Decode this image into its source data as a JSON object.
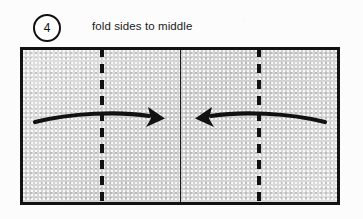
{
  "page": {
    "background_color": "#fcfcfc",
    "width": 363,
    "height": 219
  },
  "step": {
    "number": "4",
    "caption": "fold sides to middle",
    "badge_shape": "circle",
    "badge_border_color": "#111111",
    "text_color": "#1a1a1a"
  },
  "figure": {
    "name": "paper-rectangle",
    "fill_color": "#d4d4d4",
    "border_color": "#121212",
    "border_width_px": 3,
    "x": 20,
    "y": 47,
    "width": 320,
    "height": 158,
    "creases": [
      {
        "name": "left-fold-line",
        "style": "dashed",
        "orientation": "vertical",
        "x_percent": 24.4,
        "color": "#111111"
      },
      {
        "name": "center-line",
        "style": "solid",
        "orientation": "vertical",
        "x_percent": 50.0,
        "color": "#1b1b1b"
      },
      {
        "name": "right-fold-line",
        "style": "dashed",
        "orientation": "vertical",
        "x_percent": 74.4,
        "color": "#111111"
      }
    ],
    "arrows": [
      {
        "name": "left-fold-arrow",
        "direction": "right",
        "label": "fold left side toward middle",
        "color": "#111111"
      },
      {
        "name": "right-fold-arrow",
        "direction": "left",
        "label": "fold right side toward middle",
        "color": "#111111"
      }
    ]
  }
}
